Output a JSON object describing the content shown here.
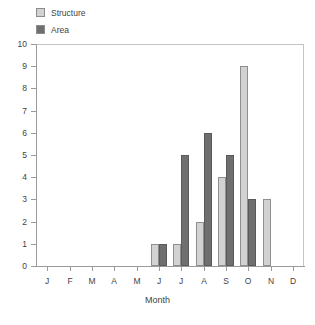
{
  "chart_data": {
    "type": "bar",
    "title": "",
    "xlabel": "Month",
    "ylabel": "",
    "ylim": [
      0,
      10
    ],
    "ytick_labels": [
      "0",
      "1",
      "2",
      "3",
      "4",
      "5",
      "6",
      "7",
      "8",
      "9",
      "10"
    ],
    "grid": false,
    "legend_position": "top-left",
    "categories": [
      "J",
      "F",
      "M",
      "A",
      "M",
      "J",
      "J",
      "A",
      "S",
      "O",
      "N",
      "D"
    ],
    "series": [
      {
        "name": "Structure",
        "color": "#d2d2d2",
        "values": [
          0,
          0,
          0,
          0,
          0,
          1,
          1,
          2,
          4,
          9,
          3,
          0
        ]
      },
      {
        "name": "Area",
        "color": "#6f6f6f",
        "values": [
          0,
          0,
          0,
          0,
          0,
          1,
          5,
          6,
          5,
          3,
          0,
          0
        ]
      }
    ]
  },
  "legend": {
    "items": [
      {
        "label": "Structure",
        "swatch": "legend-swatch-structure"
      },
      {
        "label": "Area",
        "swatch": "legend-swatch-area"
      }
    ]
  }
}
